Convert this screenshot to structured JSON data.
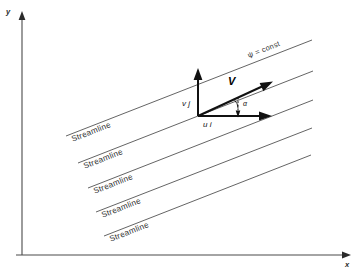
{
  "figure": {
    "background_color": "#ffffff",
    "line_color": "#525252",
    "vector_color": "#111111",
    "axis_color": "#4a4a4a"
  },
  "axes": {
    "y_label": "y",
    "x_label": "x",
    "origin": {
      "x": 22,
      "y": 255
    },
    "y_top": {
      "x": 22,
      "y": 14
    },
    "x_right": {
      "x": 348,
      "y": 255
    }
  },
  "streamlines": {
    "label": "Streamline",
    "count": 5,
    "slope_label": "constant slope, parallel family",
    "items": [
      {
        "label": "Streamline",
        "x1": 66,
        "y1": 136,
        "x2": 312,
        "y2": 40
      },
      {
        "label": "Streamline",
        "x1": 78,
        "y1": 163,
        "x2": 313,
        "y2": 71
      },
      {
        "label": "Streamline",
        "x1": 88,
        "y1": 188,
        "x2": 313,
        "y2": 100
      },
      {
        "label": "Streamline",
        "x1": 96,
        "y1": 212,
        "x2": 312,
        "y2": 128
      },
      {
        "label": "Streamline",
        "x1": 104,
        "y1": 236,
        "x2": 311,
        "y2": 155
      }
    ]
  },
  "annotations": {
    "psi_const": "ψ = const",
    "velocity_vector": "V",
    "x_component": "u i",
    "y_component": "v j",
    "angle": "α"
  },
  "vectors": {
    "origin": {
      "x": 198,
      "y": 116
    },
    "resultant": {
      "label": "V",
      "tip_x": 270,
      "tip_y": 83
    },
    "x_component": {
      "label": "u i",
      "tip_x": 270,
      "tip_y": 116
    },
    "y_component": {
      "label": "v j",
      "tip_x": 198,
      "tip_y": 70
    }
  }
}
